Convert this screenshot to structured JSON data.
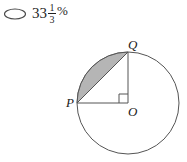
{
  "answer_choice": {
    "bubble_icon": "empty-oval-bubble",
    "whole_number": "33",
    "fraction": {
      "numerator": "1",
      "denominator": "3"
    },
    "percent_symbol": "%",
    "full_text": "33 1/3 %"
  },
  "figure": {
    "name": "circle-with-shaded-segment",
    "labels": {
      "P": "P",
      "Q": "Q",
      "O": "O"
    },
    "geometry": {
      "center": {
        "x": 128,
        "y": 103
      },
      "radius": 51,
      "point_P": {
        "x": 77,
        "y": 103
      },
      "point_Q": {
        "x": 128,
        "y": 52
      },
      "right_angle_at": "O",
      "right_angle_marker_size": 9,
      "central_angle_degrees": 90,
      "shaded_region": "circular-segment-between-chord-PQ-and-minor-arc-PQ"
    },
    "colors": {
      "stroke": "#555555",
      "shade_fill": "#b5b5b5",
      "shade_stroke": "#8a8a8a",
      "label_color": "#1a1a1a",
      "background": "#ffffff"
    }
  }
}
